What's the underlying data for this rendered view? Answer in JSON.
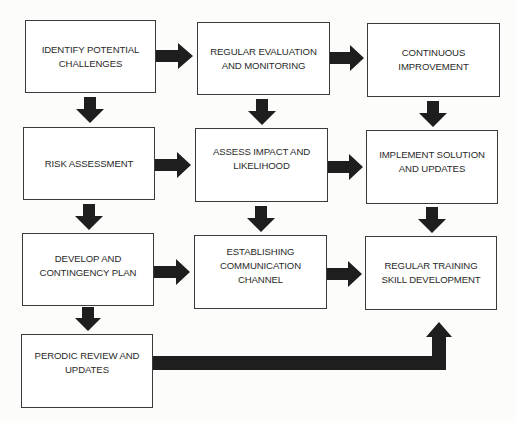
{
  "diagram": {
    "type": "flowchart",
    "nodes": [
      {
        "id": "identify",
        "label": "IDENTIFY POTENTIAL\nCHALLENGES"
      },
      {
        "id": "evaluation",
        "label": "REGULAR EVALUATION\nAND MONITORING"
      },
      {
        "id": "improvement",
        "label": "CONTINUOUS\nIMPROVEMENT"
      },
      {
        "id": "risk",
        "label": "RISK ASSESSMENT"
      },
      {
        "id": "impact",
        "label": "ASSESS IMPACT AND\nLIKELIHOOD"
      },
      {
        "id": "implement",
        "label": "IMPLEMENT SOLUTION\nAND UPDATES"
      },
      {
        "id": "contingency",
        "label": "DEVELOP AND\nCONTINGENCY PLAN"
      },
      {
        "id": "communication",
        "label": "ESTABLISHING\nCOMMUNICATION\nCHANNEL"
      },
      {
        "id": "training",
        "label": "REGULAR TRAINING\nSKILL DEVELOPMENT"
      },
      {
        "id": "review",
        "label": "PERODIC REVIEW AND\nUPDATES"
      }
    ],
    "edges": [
      {
        "from": "identify",
        "to": "evaluation"
      },
      {
        "from": "evaluation",
        "to": "improvement"
      },
      {
        "from": "identify",
        "to": "risk"
      },
      {
        "from": "evaluation",
        "to": "impact"
      },
      {
        "from": "improvement",
        "to": "implement"
      },
      {
        "from": "risk",
        "to": "impact"
      },
      {
        "from": "impact",
        "to": "implement"
      },
      {
        "from": "risk",
        "to": "contingency"
      },
      {
        "from": "impact",
        "to": "communication"
      },
      {
        "from": "implement",
        "to": "training"
      },
      {
        "from": "contingency",
        "to": "communication"
      },
      {
        "from": "communication",
        "to": "training"
      },
      {
        "from": "contingency",
        "to": "review"
      },
      {
        "from": "review",
        "to": "training"
      }
    ],
    "colors": {
      "border": "#3a3a3a",
      "arrow": "#1e1e1e",
      "text": "#2a2a2a",
      "background": "#fcfcfb"
    }
  }
}
